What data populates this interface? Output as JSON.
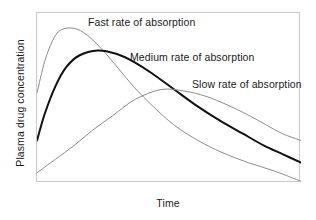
{
  "chart_data": {
    "type": "line",
    "title": "",
    "xlabel": "Time",
    "ylabel": "Plasma drug concentration",
    "grid": false,
    "legend_position": "inline-annotations",
    "xlim": [
      0,
      100
    ],
    "ylim": [
      0,
      100
    ],
    "x_ticks": [],
    "y_ticks": [],
    "axis_note": "Unitless schematic axes; no numeric tick labels shown",
    "series": [
      {
        "name": "Fast rate of absorption",
        "label": "Fast rate of absorption",
        "color": "#8c8c8c",
        "line_width": 1,
        "emphasis": false,
        "peak_time": 14,
        "peak_concentration": 91,
        "start_concentration": 53,
        "end_concentration": 1,
        "x": [
          0,
          3,
          6,
          9,
          14,
          19,
          25,
          31,
          37,
          44,
          52,
          61,
          70,
          80,
          90,
          100
        ],
        "y": [
          53,
          72,
          84,
          90,
          91,
          87,
          78,
          67,
          56,
          45,
          34,
          25,
          18,
          12,
          7,
          1
        ]
      },
      {
        "name": "Medium rate of absorption",
        "label": "Medium rate of absorption",
        "color": "#111111",
        "line_width": 2,
        "emphasis": true,
        "peak_time": 23,
        "peak_concentration": 78,
        "start_concentration": 25,
        "end_concentration": 12,
        "x": [
          0,
          3,
          7,
          11,
          16,
          23,
          30,
          37,
          44,
          52,
          60,
          69,
          78,
          86,
          93,
          100
        ],
        "y": [
          25,
          41,
          57,
          68,
          75,
          78,
          76,
          71,
          64,
          55,
          46,
          37,
          29,
          22,
          17,
          12
        ]
      },
      {
        "name": "Slow rate of absorption",
        "label": "Slow rate of absorption",
        "color": "#8c8c8c",
        "line_width": 1,
        "emphasis": false,
        "peak_time": 47,
        "peak_concentration": 55,
        "start_concentration": 6,
        "end_concentration": 25,
        "x": [
          0,
          7,
          14,
          21,
          29,
          37,
          47,
          56,
          64,
          72,
          80,
          87,
          93,
          100
        ],
        "y": [
          6,
          14,
          22,
          31,
          40,
          49,
          55,
          54,
          51,
          46,
          40,
          34,
          29,
          25
        ]
      }
    ]
  },
  "axes": {
    "y_title": "Plasma drug concentration",
    "x_title": "Time"
  },
  "annotations": {
    "fast": "Fast rate of absorption",
    "medium": "Medium rate of absorption",
    "slow": "Slow rate of absorption"
  },
  "colors": {
    "background": "#ffffff",
    "frame": "#c9c9c9",
    "text": "#1a1a1a",
    "thin_curve": "#8c8c8c",
    "bold_curve": "#111111"
  }
}
